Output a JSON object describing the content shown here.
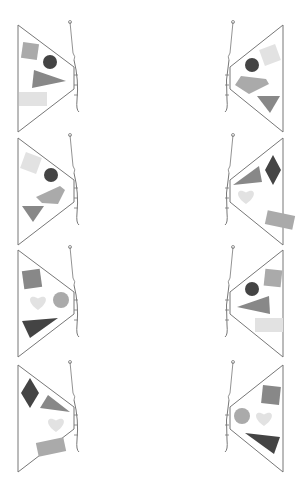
{
  "worksheet": {
    "type": "butterfly-symmetry-worksheet",
    "colors": {
      "outline": "#777777",
      "dark": "#444444",
      "medium": "#888888",
      "mid_light": "#a6a6a6",
      "light": "#dddddd",
      "lighter": "#e6e6e6"
    },
    "rows": [
      {
        "left": [
          {
            "shape": "square",
            "color": "#aaaaaa",
            "x": 30,
            "y": 51,
            "size": 16,
            "rot": 8
          },
          {
            "shape": "circle",
            "color": "#444444",
            "x": 50,
            "y": 62,
            "r": 7
          },
          {
            "shape": "triangle",
            "color": "#888888",
            "pts": "34,70 66,81 32,88"
          },
          {
            "shape": "rect",
            "color": "#e2e2e2",
            "x": 19,
            "y": 92,
            "w": 28,
            "h": 14
          }
        ],
        "right": [
          {
            "shape": "square",
            "color": "#e2e2e2",
            "x": 270,
            "y": 55,
            "size": 17,
            "rot": -20
          },
          {
            "shape": "circle",
            "color": "#444444",
            "x": 252,
            "y": 65,
            "r": 7
          },
          {
            "shape": "quad",
            "color": "#aaaaaa",
            "pts": "241,76 266,79 269,84 249,94 235,85"
          },
          {
            "shape": "triangle",
            "color": "#888888",
            "pts": "257,96 280,96 270,113"
          }
        ]
      },
      {
        "left": [
          {
            "shape": "square",
            "color": "#e2e2e2",
            "x": 31,
            "y": 163,
            "size": 17,
            "rot": 20
          },
          {
            "shape": "circle",
            "color": "#444444",
            "x": 51,
            "y": 175,
            "r": 7
          },
          {
            "shape": "quad",
            "color": "#aaaaaa",
            "pts": "36,197 60,186 65,190 58,204 42,203"
          },
          {
            "shape": "triangle",
            "color": "#888888",
            "pts": "22,206 44,206 33,222"
          }
        ],
        "right": [
          {
            "shape": "triangle",
            "color": "#888888",
            "pts": "233,185 259,166 262,182"
          },
          {
            "shape": "diamond",
            "color": "#444444",
            "x": 273,
            "y": 170,
            "w": 16,
            "h": 30
          },
          {
            "shape": "heart",
            "color": "#e2e2e2",
            "x": 246,
            "y": 196,
            "size": 20
          },
          {
            "shape": "rect",
            "color": "#aaaaaa",
            "x": 266,
            "y": 213,
            "w": 28,
            "h": 14,
            "rot": 12
          }
        ]
      },
      {
        "left": [
          {
            "shape": "square",
            "color": "#888888",
            "x": 32,
            "y": 279,
            "size": 18,
            "rot": -8
          },
          {
            "shape": "heart",
            "color": "#e2e2e2",
            "x": 38,
            "y": 302,
            "size": 20
          },
          {
            "shape": "circle",
            "color": "#aaaaaa",
            "x": 61,
            "y": 300,
            "r": 8
          },
          {
            "shape": "triangle",
            "color": "#444444",
            "pts": "22,321 58,318 30,338"
          }
        ],
        "right": [
          {
            "shape": "square",
            "color": "#aaaaaa",
            "x": 273,
            "y": 278,
            "size": 17,
            "rot": 6
          },
          {
            "shape": "circle",
            "color": "#444444",
            "x": 252,
            "y": 289,
            "r": 7
          },
          {
            "shape": "triangle",
            "color": "#888888",
            "pts": "237,307 269,296 270,314"
          },
          {
            "shape": "rect",
            "color": "#e2e2e2",
            "x": 255,
            "y": 318,
            "w": 28,
            "h": 14
          }
        ]
      },
      {
        "left": [
          {
            "shape": "diamond",
            "color": "#444444",
            "x": 30,
            "y": 393,
            "w": 18,
            "h": 30
          },
          {
            "shape": "triangle",
            "color": "#888888",
            "pts": "48,395 70,412 40,408"
          },
          {
            "shape": "heart",
            "color": "#e2e2e2",
            "x": 56,
            "y": 424,
            "size": 20
          },
          {
            "shape": "rect",
            "color": "#aaaaaa",
            "x": 37,
            "y": 440,
            "w": 28,
            "h": 14,
            "rot": -12
          }
        ],
        "right": [
          {
            "shape": "square",
            "color": "#888888",
            "x": 271,
            "y": 395,
            "size": 18,
            "rot": 6
          },
          {
            "shape": "circle",
            "color": "#aaaaaa",
            "x": 242,
            "y": 416,
            "r": 8
          },
          {
            "shape": "heart",
            "color": "#e2e2e2",
            "x": 264,
            "y": 418,
            "size": 20
          },
          {
            "shape": "triangle",
            "color": "#444444",
            "pts": "245,433 280,437 274,454"
          }
        ]
      }
    ]
  }
}
